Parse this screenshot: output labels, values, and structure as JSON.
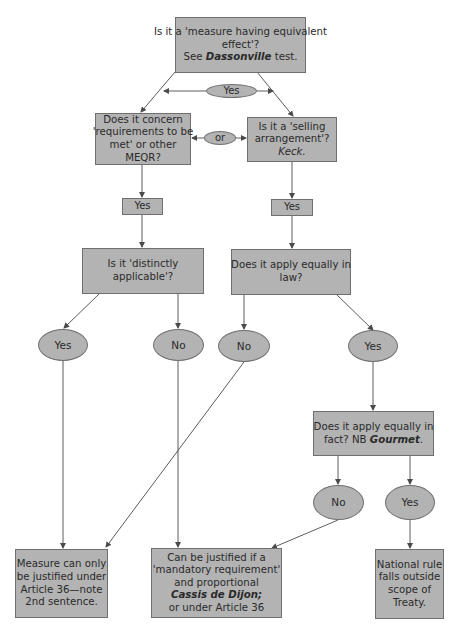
{
  "diagram": {
    "colors": {
      "node_fill": "#b3b3b3",
      "node_border": "#6f6f6f",
      "line": "#4a4a4a",
      "background": "#ffffff"
    },
    "nodes": {
      "top_question": {
        "line1": "Is it a 'measure having equivalent",
        "line2": "effect'?",
        "line3_prefix": "See ",
        "line3_case": "Dassonville",
        "line3_suffix": " test."
      },
      "yes_split": "Yes",
      "left_question": {
        "line1": "Does it concern",
        "line2": "'requirements to be",
        "line3": "met' or other",
        "line4": "MEQR?"
      },
      "or_connector": "or",
      "right_question": {
        "line1": "Is it a 'selling",
        "line2": "arrangement'?",
        "line3": "Keck."
      },
      "left_yes": "Yes",
      "right_yes": "Yes",
      "distinctly_question": {
        "line1": "Is it 'distinctly",
        "line2": "applicable'?"
      },
      "law_question": {
        "line1": "Does it apply equally in",
        "line2": "law?"
      },
      "distinct_yes": "Yes",
      "distinct_no": "No",
      "law_no": "No",
      "law_yes": "Yes",
      "fact_question": {
        "line1": "Does it apply equally in",
        "line2_prefix": "fact? NB ",
        "line2_case": "Gourmet",
        "line2_suffix": "."
      },
      "fact_no": "No",
      "fact_yes": "Yes",
      "outcome_article36": {
        "line1": "Measure can only",
        "line2": "be justified under",
        "line3": "Article 36—note",
        "line4": "2nd sentence."
      },
      "outcome_cassis": {
        "line1": "Can be justified if a",
        "line2": "'mandatory requirement'",
        "line3": "and proportional",
        "line4_case": "Cassis de Dijon;",
        "line5": "or under Article 36"
      },
      "outcome_outside": {
        "line1": "National rule",
        "line2": "falls outside",
        "line3": "scope of",
        "line4": "Treaty."
      }
    },
    "edges": [
      {
        "from": "top_question",
        "to": "left_question",
        "via": "yes_split"
      },
      {
        "from": "top_question",
        "to": "right_question",
        "via": "yes_split"
      },
      {
        "from": "left_question",
        "to": "right_question",
        "via": "or_connector"
      },
      {
        "from": "left_question",
        "to": "left_yes"
      },
      {
        "from": "right_question",
        "to": "right_yes"
      },
      {
        "from": "left_yes",
        "to": "distinctly_question"
      },
      {
        "from": "right_yes",
        "to": "law_question"
      },
      {
        "from": "distinctly_question",
        "to": "distinct_yes"
      },
      {
        "from": "distinctly_question",
        "to": "distinct_no"
      },
      {
        "from": "law_question",
        "to": "law_no"
      },
      {
        "from": "law_question",
        "to": "law_yes"
      },
      {
        "from": "distinct_yes",
        "to": "outcome_article36"
      },
      {
        "from": "law_no",
        "to": "outcome_article36"
      },
      {
        "from": "distinct_no",
        "to": "outcome_cassis"
      },
      {
        "from": "law_yes",
        "to": "fact_question"
      },
      {
        "from": "fact_question",
        "to": "fact_no"
      },
      {
        "from": "fact_question",
        "to": "fact_yes"
      },
      {
        "from": "fact_no",
        "to": "outcome_cassis"
      },
      {
        "from": "fact_yes",
        "to": "outcome_outside"
      }
    ]
  }
}
